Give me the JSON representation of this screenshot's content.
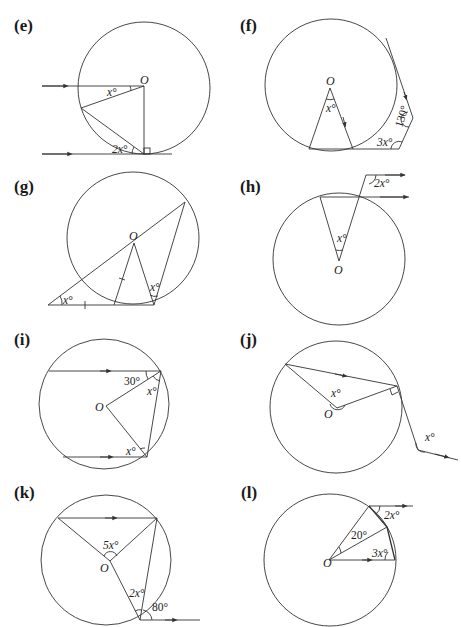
{
  "figures": [
    {
      "id": "e",
      "label": "(e)",
      "center_label": "O",
      "angles": [
        "x°",
        "2x°"
      ],
      "notes": "Two parallel arrowed lines; bottom is tangent with right angle at tangent point"
    },
    {
      "id": "f",
      "label": "(f)",
      "center_label": "O",
      "angles": [
        "x°",
        "130°",
        "3x°"
      ],
      "notes": "Isosceles triangle from O to chord; tangents form pentagon corner"
    },
    {
      "id": "g",
      "label": "(g)",
      "center_label": "O",
      "angles": [
        "x°",
        "x°"
      ],
      "notes": "Secant through O meets tangent line; equal-length tick marks"
    },
    {
      "id": "h",
      "label": "(h)",
      "center_label": "O",
      "angles": [
        "x°",
        "2x°"
      ],
      "notes": "Parallel arrowed lines above chord"
    },
    {
      "id": "i",
      "label": "(i)",
      "center_label": "O",
      "angles": [
        "30°",
        "x°",
        "x°"
      ],
      "notes": "Two parallel chords with arrows"
    },
    {
      "id": "j",
      "label": "(j)",
      "center_label": "O",
      "angles": [
        "x°",
        "x°"
      ],
      "notes": "Chord parallel to external line; right angle at circumference"
    },
    {
      "id": "k",
      "label": "(k)",
      "center_label": "O",
      "angles": [
        "5x°",
        "2x°",
        "80°"
      ],
      "notes": "Chord parallel to tangent at bottom"
    },
    {
      "id": "l",
      "label": "(l)",
      "center_label": "O",
      "angles": [
        "20°",
        "2x°",
        "3x°"
      ],
      "notes": "Radius parallel to tangent line"
    }
  ]
}
